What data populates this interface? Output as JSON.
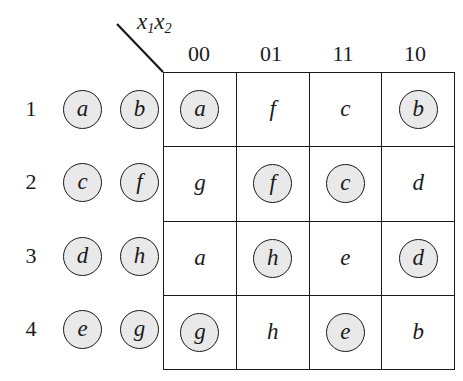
{
  "figure": {
    "type": "karnaugh-map-assignment-table",
    "axis_label": {
      "variable": "x",
      "sub1": "1",
      "sub2": "2",
      "text": "x1x2"
    },
    "column_headers": [
      "00",
      "01",
      "11",
      "10"
    ],
    "row_numbers": [
      "1",
      "2",
      "3",
      "4"
    ],
    "legend_pairs": [
      {
        "row": "1",
        "tokens": [
          {
            "label": "a",
            "circled": true
          },
          {
            "label": "b",
            "circled": true
          }
        ]
      },
      {
        "row": "2",
        "tokens": [
          {
            "label": "c",
            "circled": true
          },
          {
            "label": "f",
            "circled": true
          }
        ]
      },
      {
        "row": "3",
        "tokens": [
          {
            "label": "d",
            "circled": true
          },
          {
            "label": "h",
            "circled": true
          }
        ]
      },
      {
        "row": "4",
        "tokens": [
          {
            "label": "e",
            "circled": true
          },
          {
            "label": "g",
            "circled": true
          }
        ]
      }
    ],
    "grid": [
      [
        {
          "label": "a",
          "circled": true
        },
        {
          "label": "f",
          "circled": false
        },
        {
          "label": "c",
          "circled": false
        },
        {
          "label": "b",
          "circled": true
        }
      ],
      [
        {
          "label": "g",
          "circled": false
        },
        {
          "label": "f",
          "circled": true
        },
        {
          "label": "c",
          "circled": true
        },
        {
          "label": "d",
          "circled": false
        }
      ],
      [
        {
          "label": "a",
          "circled": false
        },
        {
          "label": "h",
          "circled": true
        },
        {
          "label": "e",
          "circled": false
        },
        {
          "label": "d",
          "circled": true
        }
      ],
      [
        {
          "label": "g",
          "circled": true
        },
        {
          "label": "h",
          "circled": false
        },
        {
          "label": "e",
          "circled": true
        },
        {
          "label": "b",
          "circled": false
        }
      ]
    ],
    "colors": {
      "ink": "#1a1a1a",
      "circle_fill": "#e9e9e9",
      "background": "#ffffff"
    }
  }
}
